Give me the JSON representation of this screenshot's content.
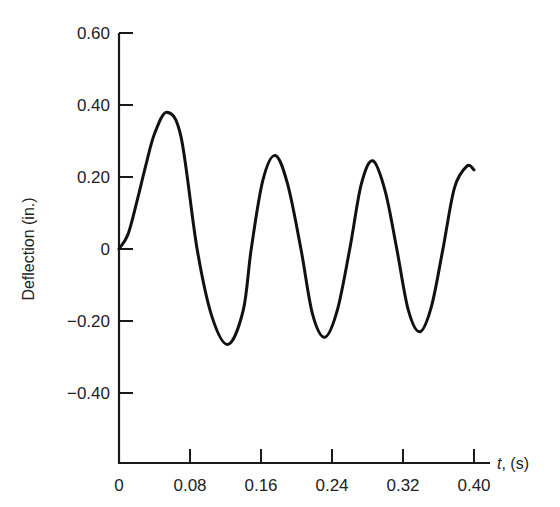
{
  "chart_data": {
    "type": "line",
    "title": "",
    "xlabel_italic": "t",
    "xlabel_rest": ", (s)",
    "xlabel": "t, (s)",
    "ylabel": "Deflection (in.)",
    "xlim": [
      0,
      0.4
    ],
    "ylim": [
      -0.6,
      0.6
    ],
    "grid": false,
    "legend": "none",
    "x_ticks": [
      0,
      0.08,
      0.16,
      0.24,
      0.32,
      0.4
    ],
    "x_tick_labels": [
      "0",
      "0.08",
      "0.16",
      "0.24",
      "0.32",
      "0.40"
    ],
    "y_ticks": [
      0.6,
      0.4,
      0.2,
      0,
      -0.2,
      -0.4
    ],
    "y_tick_labels": [
      "0.60",
      "0.40",
      "0.20",
      "0",
      "−0.20",
      "−0.40"
    ],
    "series": [
      {
        "name": "deflection",
        "color": "#111111",
        "x": [
          0,
          0.01,
          0.02,
          0.03,
          0.04,
          0.054,
          0.07,
          0.088,
          0.105,
          0.123,
          0.14,
          0.149,
          0.162,
          0.176,
          0.19,
          0.205,
          0.218,
          0.232,
          0.246,
          0.26,
          0.273,
          0.286,
          0.3,
          0.313,
          0.326,
          0.339,
          0.352,
          0.365,
          0.378,
          0.392,
          0.4
        ],
        "y": [
          0,
          0.04,
          0.13,
          0.23,
          0.32,
          0.38,
          0.31,
          0,
          -0.19,
          -0.265,
          -0.17,
          0,
          0.19,
          0.26,
          0.18,
          0,
          -0.18,
          -0.245,
          -0.17,
          0,
          0.18,
          0.245,
          0.16,
          0,
          -0.17,
          -0.23,
          -0.16,
          0,
          0.17,
          0.23,
          0.22
        ]
      }
    ]
  }
}
